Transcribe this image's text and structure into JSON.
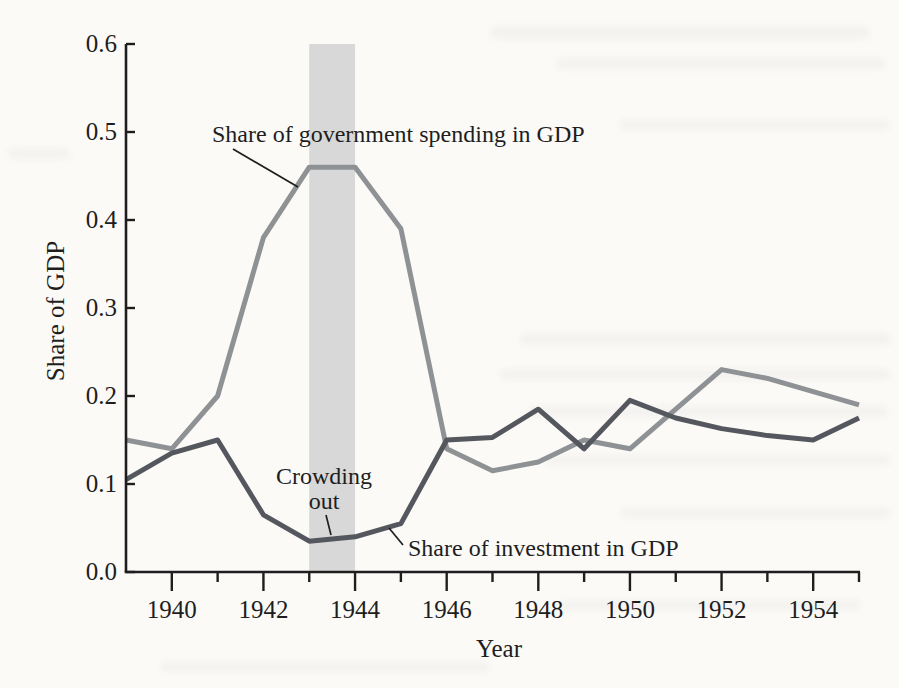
{
  "colors": {
    "page_background": "#fbfaf7",
    "text": "#1e1e1e",
    "axis": "#1e1e1e",
    "government_line": "#8e9295",
    "investment_line": "#54585e",
    "shaded_band": "#d8d8d8"
  },
  "labels": {
    "y_axis_title": "Share of GDP",
    "x_axis_title": "Year",
    "government_annotation": "Share of government spending in GDP",
    "crowding_annotation_line1": "Crowding",
    "crowding_annotation_line2": "out",
    "investment_annotation": "Share of investment in GDP"
  },
  "chart_data": {
    "type": "line",
    "title": "",
    "xlabel": "Year",
    "ylabel": "Share of GDP",
    "xlim": [
      1939,
      1955
    ],
    "ylim": [
      0.0,
      0.6
    ],
    "grid": false,
    "legend": "inline-annotations",
    "x": [
      1939,
      1940,
      1941,
      1942,
      1943,
      1944,
      1945,
      1946,
      1947,
      1948,
      1949,
      1950,
      1951,
      1952,
      1953,
      1954,
      1955
    ],
    "series": [
      {
        "id": "government-spending",
        "name": "Share of government spending in GDP",
        "color": "#8e9295",
        "values": [
          0.15,
          0.14,
          0.2,
          0.38,
          0.46,
          0.46,
          0.39,
          0.14,
          0.115,
          0.125,
          0.15,
          0.14,
          0.185,
          0.23,
          0.22,
          0.205,
          0.19
        ]
      },
      {
        "id": "investment",
        "name": "Share of investment in GDP",
        "color": "#54585e",
        "values": [
          0.105,
          0.135,
          0.15,
          0.065,
          0.035,
          0.04,
          0.055,
          0.15,
          0.153,
          0.185,
          0.14,
          0.195,
          0.175,
          0.163,
          0.155,
          0.15,
          0.175
        ]
      }
    ],
    "y_ticks": [
      0.0,
      0.1,
      0.2,
      0.3,
      0.4,
      0.5,
      0.6
    ],
    "x_major_ticks": [
      1940,
      1942,
      1944,
      1946,
      1948,
      1950,
      1952,
      1954
    ],
    "x_minor_ticks": [
      1941,
      1943,
      1945,
      1947,
      1949,
      1951,
      1953,
      1955
    ],
    "shaded_region": {
      "from": 1943,
      "to": 1944,
      "label": "Crowding out",
      "color": "#d8d8d8"
    }
  }
}
